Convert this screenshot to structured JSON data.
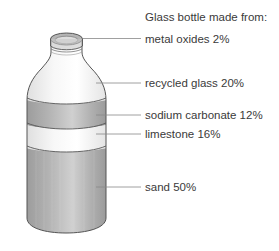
{
  "title": "Glass bottle made from:",
  "components": [
    {
      "name": "metal oxides",
      "percent": "2%",
      "label": "metal oxides 2%"
    },
    {
      "name": "recycled glass",
      "percent": "20%",
      "label": "recycled glass 20%"
    },
    {
      "name": "sodium carbonate",
      "percent": "12%",
      "label": "sodium carbonate 12%"
    },
    {
      "name": "limestone",
      "percent": "16%",
      "label": "limestone 16%"
    },
    {
      "name": "sand",
      "percent": "50%",
      "label": "sand 50%"
    }
  ],
  "colors": {
    "dark_band": "#a8a8a8",
    "light_glass": "#f2f2f2",
    "outline": "#555555",
    "leader_line": "#888888",
    "text": "#3a3a3a"
  }
}
